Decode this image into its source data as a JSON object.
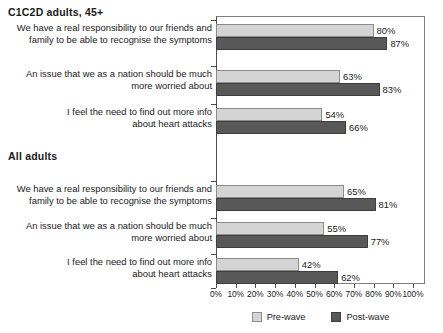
{
  "chart_data": {
    "type": "bar",
    "orientation": "horizontal",
    "title": "",
    "xlabel": "",
    "ylabel": "",
    "xlim": [
      0,
      100
    ],
    "xticks": [
      "0%",
      "10%",
      "20%",
      "30%",
      "40%",
      "50%",
      "60%",
      "70%",
      "80%",
      "90%",
      "100%"
    ],
    "grid": false,
    "legend_position": "bottom-center",
    "series": [
      {
        "name": "Pre-wave",
        "color": "#d4d4d4"
      },
      {
        "name": "Post-wave",
        "color": "#585858"
      }
    ],
    "groups": [
      {
        "header": "C1C2D  adults, 45+",
        "categories": [
          {
            "line1": "We have a real responsibility to our friends and",
            "line2": "family to be able to recognise the symptoms",
            "pre": 80,
            "post": 87,
            "pre_label": "80%",
            "post_label": "87%"
          },
          {
            "line1": "An issue that we as a nation should be much",
            "line2": "more worried about",
            "pre": 63,
            "post": 83,
            "pre_label": "63%",
            "post_label": "83%"
          },
          {
            "line1": "I feel the need to find out more info",
            "line2": "about heart attacks",
            "pre": 54,
            "post": 66,
            "pre_label": "54%",
            "post_label": "66%"
          }
        ]
      },
      {
        "header": "All adults",
        "categories": [
          {
            "line1": "We have a real responsibility to our friends and",
            "line2": "family to be able to recognise the symptoms",
            "pre": 65,
            "post": 81,
            "pre_label": "65%",
            "post_label": "81%"
          },
          {
            "line1": "An issue that we as a nation should be much",
            "line2": "more worried about",
            "pre": 55,
            "post": 77,
            "pre_label": "55%",
            "post_label": "77%"
          },
          {
            "line1": "I feel the need to find out more info",
            "line2": "about heart attacks",
            "pre": 42,
            "post": 62,
            "pre_label": "42%",
            "post_label": "62%"
          }
        ]
      }
    ]
  }
}
